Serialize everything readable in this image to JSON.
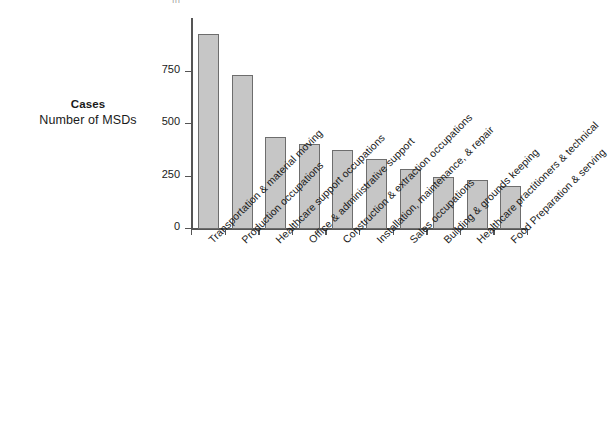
{
  "figure": {
    "top_fragment": "|||",
    "axis_title_main": "Cases",
    "axis_title_sub": "Number of MSDs"
  },
  "chart_data": {
    "type": "bar",
    "title": "",
    "subtitle": "",
    "xlabel": "",
    "ylabel": "Cases\nNumber of MSDs",
    "ylim": [
      0,
      1000
    ],
    "yticks": [
      0,
      250,
      500,
      750
    ],
    "ytick_labels": [
      "0",
      "250",
      "500",
      "750"
    ],
    "grid": false,
    "legend": false,
    "orientation": "vertical",
    "bar_fill_color": "#c6c6c6",
    "bar_edge_color": "#6d6d6d",
    "axis_color": "#555555",
    "categories": [
      "Transportation & material moving",
      "Production occupations",
      "Healthcare support occupations",
      "Office & administrative support",
      "Construction & extraction occupations",
      "Installation, maintenance, & repair",
      "Sales occupations",
      "Building & grounds keeping",
      "Healthcare practitioners & technical",
      "Food Preparation & serving"
    ],
    "values": [
      930,
      735,
      440,
      405,
      375,
      335,
      285,
      250,
      235,
      205
    ]
  }
}
